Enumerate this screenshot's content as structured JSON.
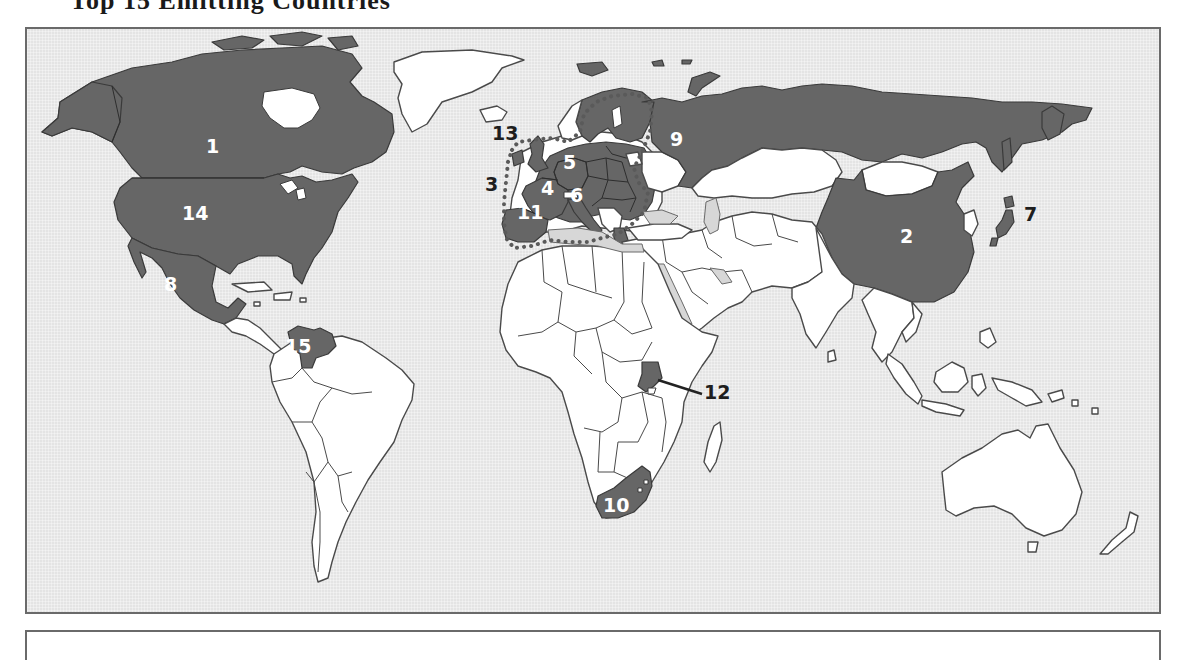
{
  "title": "Top 15 Emitting Countries",
  "colors": {
    "ocean": "#e4e4e4",
    "land": "#ffffff",
    "highlighted": "#666666",
    "inland_sea": "#d7d7d7",
    "frame_border": "#6a6a6a",
    "label_on_dark": "#ffffff",
    "label_on_light": "#1e1e1e"
  },
  "map": {
    "projection": "world",
    "labels": [
      {
        "number": "1",
        "region": "Canada",
        "on": "dark"
      },
      {
        "number": "2",
        "region": "China",
        "on": "dark"
      },
      {
        "number": "3",
        "region": "European Union (dotted outline)",
        "on": "light"
      },
      {
        "number": "4",
        "region": "France",
        "on": "dark"
      },
      {
        "number": "5",
        "region": "Germany",
        "on": "dark"
      },
      {
        "number": "6",
        "region": "Italy",
        "on": "dark"
      },
      {
        "number": "7",
        "region": "Japan",
        "on": "light"
      },
      {
        "number": "8",
        "region": "Mexico",
        "on": "dark"
      },
      {
        "number": "9",
        "region": "Russia",
        "on": "dark"
      },
      {
        "number": "10",
        "region": "South Africa",
        "on": "dark"
      },
      {
        "number": "11",
        "region": "Spain",
        "on": "dark"
      },
      {
        "number": "12",
        "region": "Uganda",
        "on": "light",
        "leader_line": true
      },
      {
        "number": "13",
        "region": "United Kingdom",
        "on": "light"
      },
      {
        "number": "14",
        "region": "United States",
        "on": "dark"
      },
      {
        "number": "15",
        "region": "Venezuela",
        "on": "dark"
      }
    ]
  }
}
